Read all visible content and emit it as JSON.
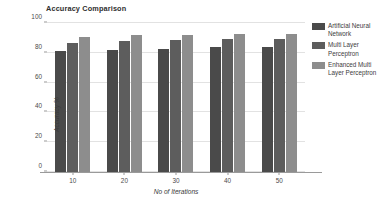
{
  "chart_data": {
    "type": "bar",
    "title": "Accuracy Comparison",
    "xlabel": "No of Iterations",
    "ylabel": "Accuracy %",
    "categories": [
      "10",
      "20",
      "30",
      "40",
      "50"
    ],
    "series": [
      {
        "name": "Artificial Neural Network",
        "color": "#4a4a4a",
        "values": [
          81.5,
          82,
          82.5,
          84,
          84
        ]
      },
      {
        "name": "Multi Layer Perceptron",
        "color": "#5d5d5d",
        "values": [
          86.5,
          88,
          88.5,
          89,
          89.5
        ]
      },
      {
        "name": "Enhanced Multi Layer Perceptron",
        "color": "#8d8d8d",
        "values": [
          90.5,
          92,
          92,
          92.5,
          92.5
        ]
      }
    ],
    "ylim": [
      0,
      100
    ],
    "yticks": [
      0,
      20,
      40,
      60,
      80,
      100
    ],
    "ytick_labels": [
      "0",
      "20",
      "40",
      "60",
      "80",
      "100"
    ],
    "grid": true,
    "legend_position": "right"
  },
  "legend": {
    "entries": [
      "Artificial Neural Network",
      "Multi Layer Perceptron",
      "Enhanced Multi Layer Perceptron"
    ]
  }
}
